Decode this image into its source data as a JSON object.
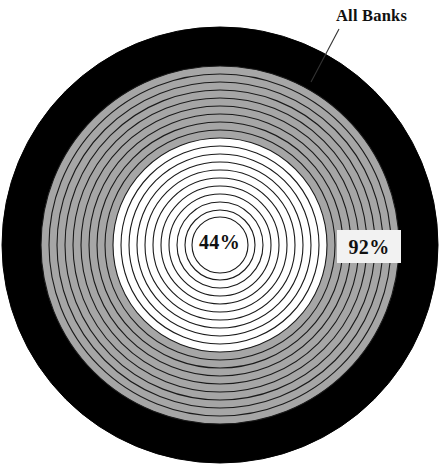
{
  "figure": {
    "kind": "concentric-ring-target-chart",
    "background_color": "#ffffff",
    "annotations": {
      "outer_label": "All Banks",
      "outer_value": "92%",
      "center_value": "44%"
    },
    "colors": {
      "outer_band": "#000000",
      "mid_band": "#a6a6a6",
      "inner_band": "#ffffff",
      "ring_stroke": "#1a1a1a",
      "value_box_background": "#f2f2f2",
      "text": "#111111",
      "leader_line": "#333333"
    },
    "geometry": {
      "center_x": 220,
      "center_y": 245,
      "outer_radius": 218
    }
  },
  "chart_data": {
    "type": "pie",
    "title": "",
    "subtitle": "",
    "xlabel": "",
    "ylabel": "",
    "legend_position": "none",
    "grid": false,
    "categories": [
      "All Banks",
      "Center"
    ],
    "values": [
      92,
      44
    ],
    "value_unit": "percent",
    "ylim": [
      0,
      100
    ],
    "rings": [
      {
        "index": 0,
        "radius": 218,
        "fill": "#000000",
        "label": "All Banks",
        "value": 92
      },
      {
        "index": 1,
        "radius": 179,
        "fill": "#a6a6a6",
        "label": "",
        "value": null
      },
      {
        "index": 2,
        "radius": 171,
        "fill": "#a6a6a6",
        "label": "",
        "value": null
      },
      {
        "index": 3,
        "radius": 163,
        "fill": "#a6a6a6",
        "label": "",
        "value": null
      },
      {
        "index": 4,
        "radius": 155,
        "fill": "#a6a6a6",
        "label": "",
        "value": null
      },
      {
        "index": 5,
        "radius": 147,
        "fill": "#a6a6a6",
        "label": "",
        "value": null
      },
      {
        "index": 6,
        "radius": 139,
        "fill": "#a6a6a6",
        "label": "",
        "value": null
      },
      {
        "index": 7,
        "radius": 131,
        "fill": "#a6a6a6",
        "label": "",
        "value": null
      },
      {
        "index": 8,
        "radius": 123,
        "fill": "#a6a6a6",
        "label": "",
        "value": null
      },
      {
        "index": 9,
        "radius": 115,
        "fill": "#a6a6a6",
        "label": "",
        "value": null
      },
      {
        "index": 10,
        "radius": 107,
        "fill": "#ffffff",
        "label": "",
        "value": null
      },
      {
        "index": 11,
        "radius": 99,
        "fill": "#ffffff",
        "label": "",
        "value": null
      },
      {
        "index": 12,
        "radius": 91,
        "fill": "#ffffff",
        "label": "",
        "value": null
      },
      {
        "index": 13,
        "radius": 83,
        "fill": "#ffffff",
        "label": "",
        "value": null
      },
      {
        "index": 14,
        "radius": 75,
        "fill": "#ffffff",
        "label": "",
        "value": null
      },
      {
        "index": 15,
        "radius": 67,
        "fill": "#ffffff",
        "label": "",
        "value": null
      },
      {
        "index": 16,
        "radius": 59,
        "fill": "#ffffff",
        "label": "",
        "value": null
      },
      {
        "index": 17,
        "radius": 51,
        "fill": "#ffffff",
        "label": "",
        "value": null
      },
      {
        "index": 18,
        "radius": 43,
        "fill": "#ffffff",
        "label": "",
        "value": null
      },
      {
        "index": 19,
        "radius": 35,
        "fill": "#ffffff",
        "label": "",
        "value": null
      },
      {
        "index": 20,
        "radius": 28,
        "fill": "#ffffff",
        "label": "44%",
        "value": 44
      }
    ]
  }
}
